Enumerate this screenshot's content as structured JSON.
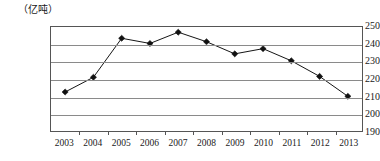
{
  "chart_data": {
    "type": "line",
    "title": "",
    "subtitle": "",
    "xlabel": "",
    "ylabel": "（亿吨）",
    "unit_label": "（亿吨）",
    "categories": [
      "2003",
      "2004",
      "2005",
      "2006",
      "2007",
      "2008",
      "2009",
      "2010",
      "2011",
      "2012",
      "2013"
    ],
    "values": [
      212.5,
      221,
      243.5,
      240.5,
      247,
      241.5,
      234.5,
      237.5,
      230.5,
      221.5,
      210
    ],
    "series": [
      {
        "name": "",
        "values": [
          212.5,
          221,
          243.5,
          240.5,
          247,
          241.5,
          234.5,
          237.5,
          230.5,
          221.5,
          210
        ]
      }
    ],
    "ylim": [
      190,
      250
    ],
    "yticks": [
      250,
      240,
      230,
      220,
      210,
      200,
      190
    ],
    "ytick_labels": [
      "250",
      "240",
      "230",
      "220",
      "210",
      "200",
      "190"
    ],
    "xlim": [
      "2003",
      "2013"
    ],
    "grid": true,
    "grid_axis": "y",
    "legend": false,
    "legend_position": "none",
    "marker": "diamond",
    "line_color": "#111111",
    "marker_color": "#111111",
    "grid_color": "#8a8a8a",
    "border_color": "#555555",
    "background_color": "#ffffff"
  }
}
